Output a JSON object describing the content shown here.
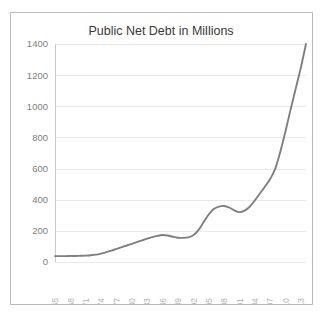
{
  "page": {
    "background_color": "#ffffff",
    "frame_border_color": "#b9b9b9"
  },
  "chart_data": {
    "type": "line",
    "title": "Public Net Debt in Millions",
    "xlabel": "",
    "ylabel": "",
    "ylim": [
      0,
      1400
    ],
    "xlim": [
      1965,
      2014
    ],
    "grid": "horizontal",
    "legend": "none",
    "line_color": "#7f7f7f",
    "gridline_color": "#e9e9e9",
    "ytick_color": "#7d7d7d",
    "xtick_color": "#b2b2b2",
    "ytick_labels": [
      "0",
      "200",
      "400",
      "600",
      "800",
      "1000",
      "1200",
      "1400"
    ],
    "ytick_values": [
      0,
      200,
      400,
      600,
      800,
      1000,
      1200,
      1400
    ],
    "xtick_labels": [
      "1965",
      "1968",
      "1971",
      "1974",
      "1977",
      "1980",
      "1983",
      "1986",
      "1989",
      "1992",
      "1995",
      "1998",
      "2001",
      "2004",
      "2007",
      "2010",
      "2013"
    ],
    "xtick_values": [
      1965,
      1968,
      1971,
      1974,
      1977,
      1980,
      1983,
      1986,
      1989,
      1992,
      1995,
      1998,
      2001,
      2004,
      2007,
      2010,
      2013
    ],
    "x": [
      1965,
      1966,
      1967,
      1968,
      1969,
      1970,
      1971,
      1972,
      1973,
      1974,
      1975,
      1976,
      1977,
      1978,
      1979,
      1980,
      1981,
      1982,
      1983,
      1984,
      1985,
      1986,
      1987,
      1988,
      1989,
      1990,
      1991,
      1992,
      1993,
      1994,
      1995,
      1996,
      1997,
      1998,
      1999,
      2000,
      2001,
      2002,
      2003,
      2004,
      2005,
      2006,
      2007,
      2008,
      2009,
      2010,
      2011,
      2012,
      2013,
      2014
    ],
    "values": [
      38,
      38,
      38,
      39,
      39,
      40,
      41,
      43,
      47,
      54,
      63,
      73,
      84,
      95,
      106,
      117,
      128,
      139,
      150,
      160,
      168,
      173,
      170,
      162,
      156,
      155,
      158,
      172,
      205,
      255,
      305,
      340,
      356,
      360,
      350,
      332,
      320,
      330,
      355,
      395,
      440,
      485,
      533,
      600,
      710,
      840,
      980,
      1115,
      1250,
      1400
    ],
    "series_name": "Public Net Debt"
  }
}
